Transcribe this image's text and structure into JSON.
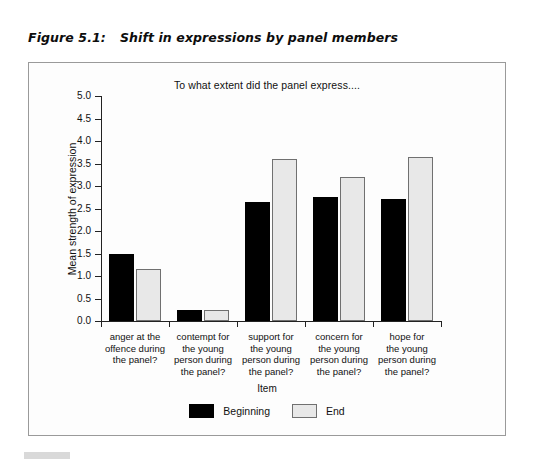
{
  "figure": {
    "number": "Figure 5.1:",
    "title": "Shift in expressions by panel members"
  },
  "chart_data": {
    "type": "bar",
    "title": "To what extent did the panel express....",
    "subtitle": "To what extent did the panel express....",
    "xlabel": "Item",
    "ylabel": "Mean strength of expression",
    "ylim": [
      0.0,
      5.0
    ],
    "ytick_labels": [
      "5.0",
      "4.5",
      "4.0",
      "3.5",
      "3.0",
      "2.5",
      "2.0",
      "1.5",
      "1.0",
      "0.5",
      "0.0"
    ],
    "ytick_values": [
      5.0,
      4.5,
      4.0,
      3.5,
      3.0,
      2.5,
      2.0,
      1.5,
      1.0,
      0.5,
      0.0
    ],
    "grid": false,
    "legend_position": "bottom",
    "legend_title": "Item",
    "categories": [
      "anger at the offence during the panel?",
      "contempt for the young person during the panel?",
      "support for the young person during the panel?",
      "concern for the young person during the panel?",
      "hope for the young person during the panel?"
    ],
    "category_lines": [
      [
        "anger at the",
        "offence during",
        "the panel?"
      ],
      [
        "contempt for",
        "the young",
        "person during",
        "the panel?"
      ],
      [
        "support for",
        "the young",
        "person during",
        "the panel?"
      ],
      [
        "concern for",
        "the young",
        "person during",
        "the panel?"
      ],
      [
        "hope for",
        "the young",
        "person during",
        "the panel?"
      ]
    ],
    "series": [
      {
        "name": "Beginning",
        "color": "#000000",
        "values": [
          1.48,
          0.25,
          2.65,
          2.75,
          2.72
        ]
      },
      {
        "name": "End",
        "color": "#e8e8e8",
        "values": [
          1.15,
          0.25,
          3.6,
          3.2,
          3.65
        ]
      }
    ]
  },
  "colors": {
    "beginning": "#000000",
    "end": "#e8e8e8",
    "end_border": "#707070",
    "axis": "#222222",
    "frame": "#9a9a9a",
    "page_background": "#ffffff"
  }
}
